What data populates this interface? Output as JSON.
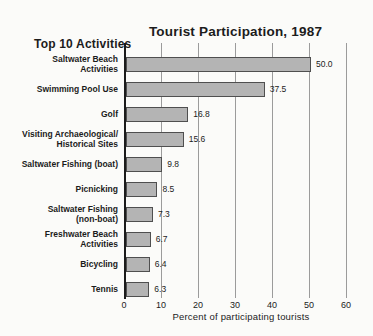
{
  "title": "Tourist Participation, 1987",
  "subtitle_left": "Top 10 Activities",
  "chart_data": {
    "type": "bar",
    "orientation": "horizontal",
    "title": "Tourist Participation, 1987",
    "categories": [
      "Saltwater Beach\nActivities",
      "Swimming Pool Use",
      "Golf",
      "Visiting Archaeological/\nHistorical Sites",
      "Saltwater Fishing (boat)",
      "Picnicking",
      "Saltwater Fishing\n(non-boat)",
      "Freshwater Beach\nActivities",
      "Bicycling",
      "Tennis"
    ],
    "values": [
      50.0,
      37.5,
      16.8,
      15.6,
      9.8,
      8.5,
      7.3,
      6.7,
      6.4,
      6.3
    ],
    "value_labels": [
      "50.0",
      "37.5",
      "16.8",
      "15.6",
      "9.8",
      "8.5",
      "7.3",
      "6.7",
      "6.4",
      "6.3"
    ],
    "xlabel": "Percent of participating tourists",
    "ylabel": "",
    "x_ticks": [
      0,
      10,
      20,
      30,
      40,
      50,
      60
    ],
    "xlim": [
      0,
      60
    ],
    "grid": true,
    "legend": "none",
    "bar_color": "#b4b4b4",
    "bar_border_color": "#4f4f4f",
    "gridline_color": "#9b9b9b",
    "axis_color": "#1b1b1b"
  }
}
